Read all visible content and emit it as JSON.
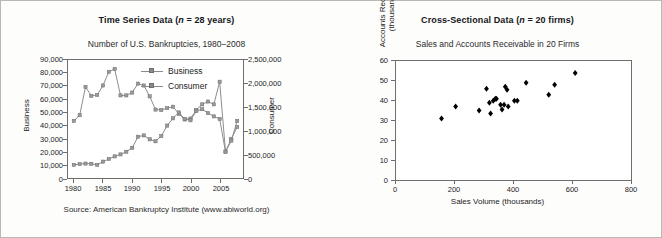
{
  "figure": {
    "background_color": "#fdfdfc",
    "border_color": "#b9b9b4"
  },
  "left_panel": {
    "title_prefix": "Time Series Data (",
    "title_italic": "n",
    "title_suffix": " = 28 years)",
    "title_full": "Time Series Data (n = 28 years)",
    "subtitle": "Number of U.S. Bankruptcies, 1980–2008",
    "source": "Source: American Bankruptcy Institute (www.abiworld.org)",
    "y_left_label": "Business",
    "y_right_label": "Consumer",
    "legend": [
      {
        "label": "Business",
        "color": "#8a8a8a"
      },
      {
        "label": "Consumer",
        "color": "#8a8a8a"
      }
    ],
    "y_left_ticks": [
      "0",
      "10,000",
      "20,000",
      "30,000",
      "40,000",
      "50,000",
      "60,000",
      "70,000",
      "80,000",
      "90,000"
    ],
    "y_right_ticks": [
      "0",
      "500,000",
      "1,000,000",
      "1,500,000",
      "2,000,000",
      "2,500,000"
    ],
    "x_ticks": [
      "1980",
      "1985",
      "1990",
      "1995",
      "2000",
      "2005"
    ]
  },
  "right_panel": {
    "title_prefix": "Cross-Sectional Data (",
    "title_italic": "n",
    "title_suffix": " = 20 firms)",
    "title_full": "Cross-Sectional Data (n = 20 firms)",
    "subtitle": "Sales and Accounts Receivable in 20 Firms",
    "y_label_line1": "Accounts Receivable",
    "y_label_line2": "(thousands)",
    "x_label": "Sales Volume (thousands)",
    "y_ticks": [
      "0",
      "10",
      "20",
      "30",
      "40",
      "50",
      "60"
    ],
    "x_ticks": [
      "0",
      "200",
      "400",
      "600",
      "800"
    ]
  },
  "chart_data": [
    {
      "type": "line",
      "title": "Time Series Data (n = 28 years)",
      "subtitle": "Number of U.S. Bankruptcies, 1980–2008",
      "xlabel": "",
      "ylabel": "Business",
      "y2label": "Consumer",
      "xlim": [
        1979,
        2009
      ],
      "ylim": [
        0,
        90000
      ],
      "y2lim": [
        0,
        2500000
      ],
      "grid": false,
      "legend_position": "upper-center",
      "annotation": "Source: American Bankruptcy Institute (www.abiworld.org)",
      "x": [
        1980,
        1981,
        1982,
        1983,
        1984,
        1985,
        1986,
        1987,
        1988,
        1989,
        1990,
        1991,
        1992,
        1993,
        1994,
        1995,
        1996,
        1997,
        1998,
        1999,
        2000,
        2001,
        2002,
        2003,
        2004,
        2005,
        2006,
        2007,
        2008
      ],
      "series": [
        {
          "name": "Business",
          "axis": "left",
          "values": [
            10000,
            10600,
            11000,
            10800,
            10000,
            12500,
            14500,
            16500,
            18000,
            20000,
            23000,
            31500,
            32500,
            29500,
            28000,
            32000,
            40000,
            45500,
            50000,
            45000,
            44000,
            51000,
            52500,
            49500,
            47000,
            45000,
            20000,
            28500,
            43500
          ]
        },
        {
          "name": "Consumer",
          "axis": "right",
          "values": [
            1210000,
            1330000,
            1930000,
            1740000,
            1760000,
            1960000,
            2250000,
            2310000,
            1750000,
            1750000,
            1810000,
            2000000,
            1960000,
            1730000,
            1450000,
            1440000,
            1480000,
            1510000,
            1360000,
            1240000,
            1260000,
            1440000,
            1560000,
            1620000,
            1560000,
            2040000,
            560000,
            830000,
            1080000
          ]
        }
      ]
    },
    {
      "type": "scatter",
      "title": "Cross-Sectional Data (n = 20 firms)",
      "subtitle": "Sales and Accounts Receivable in 20 Firms",
      "xlabel": "Sales Volume (thousands)",
      "ylabel": "Accounts Receivable (thousands)",
      "xlim": [
        0,
        800
      ],
      "ylim": [
        0,
        60
      ],
      "grid": false,
      "marker": "diamond",
      "marker_color": "#000000",
      "points": [
        {
          "x": 155,
          "y": 31
        },
        {
          "x": 203,
          "y": 37
        },
        {
          "x": 283,
          "y": 35
        },
        {
          "x": 308,
          "y": 46
        },
        {
          "x": 318,
          "y": 39
        },
        {
          "x": 322,
          "y": 33.5
        },
        {
          "x": 331,
          "y": 40
        },
        {
          "x": 338,
          "y": 41
        },
        {
          "x": 342,
          "y": 41
        },
        {
          "x": 356,
          "y": 38
        },
        {
          "x": 361,
          "y": 35.5
        },
        {
          "x": 368,
          "y": 38
        },
        {
          "x": 372,
          "y": 47
        },
        {
          "x": 378,
          "y": 45.5
        },
        {
          "x": 382,
          "y": 37
        },
        {
          "x": 403,
          "y": 40
        },
        {
          "x": 413,
          "y": 40
        },
        {
          "x": 443,
          "y": 49
        },
        {
          "x": 520,
          "y": 43
        },
        {
          "x": 540,
          "y": 48
        },
        {
          "x": 610,
          "y": 54
        }
      ]
    }
  ]
}
